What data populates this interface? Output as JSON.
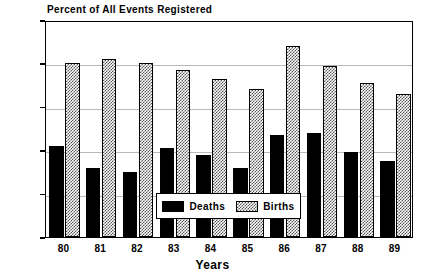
{
  "chart_data": {
    "type": "bar",
    "title": "Percent of All Events Registered",
    "xlabel": "Years",
    "ylabel": "",
    "categories": [
      "80",
      "81",
      "82",
      "83",
      "84",
      "85",
      "86",
      "87",
      "88",
      "89"
    ],
    "series": [
      {
        "name": "Deaths",
        "fill": "solid-black",
        "color": "#000000",
        "values": [
          42,
          32,
          30,
          41,
          38,
          32,
          47,
          48,
          39,
          35
        ]
      },
      {
        "name": "Births",
        "fill": "checkered-hatch",
        "color": "#555555",
        "values": [
          80,
          82,
          80,
          77,
          73,
          68,
          88,
          79,
          71,
          66
        ]
      }
    ],
    "ylim": [
      0,
      100
    ],
    "ytick_values": [
      0,
      20,
      40,
      60,
      80,
      100
    ],
    "ytick_labels": [
      "0%",
      "20%",
      "40%",
      "60%",
      "80%",
      "100%"
    ],
    "grid": true,
    "grid_axis": "y",
    "legend_position": "inside-bottom-center",
    "legend_entries": [
      "Deaths",
      "Births"
    ]
  }
}
